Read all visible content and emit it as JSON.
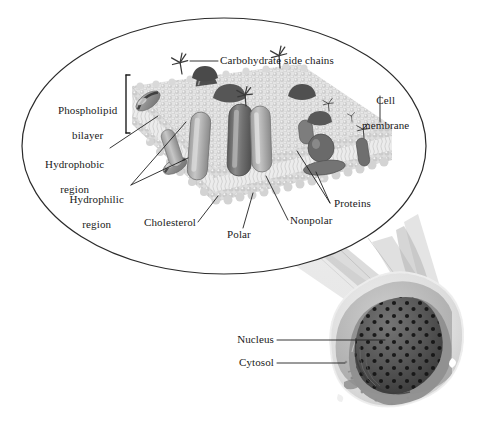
{
  "figure": {
    "background_color": "#ffffff",
    "ink_color": "#1a1a1a"
  },
  "inset": {
    "shape": "ellipse",
    "outline_color": "#2b2b2b",
    "center_x": 224,
    "center_y": 146,
    "radius_x": 202,
    "radius_y": 128
  },
  "labels": {
    "carbohydrate_side_chains": "Carbohydrate side chains",
    "cell_membrane_line1": "Cell",
    "cell_membrane_line2": "membrane",
    "phospholipid_line1": "Phospholipid",
    "phospholipid_line2": "bilayer",
    "hydrophobic_line1": "Hydrophobic",
    "hydrophobic_line2": "region",
    "hydrophilic_line1": "Hydrophilic",
    "hydrophilic_line2": "region",
    "cholesterol": "Cholesterol",
    "polar": "Polar",
    "nonpolar": "Nonpolar",
    "proteins": "Proteins",
    "nucleus": "Nucleus",
    "cytosol": "Cytosol"
  },
  "colors": {
    "membrane_head_light": "#d8d8d8",
    "membrane_head_mid": "#c4c4c4",
    "membrane_tail": "#e2e2e2",
    "protein_dark": "#6a6a6a",
    "protein_mid": "#8e8e8e",
    "protein_light": "#b0b0b0",
    "cholesterol": "#9a9a9a",
    "cell_cytoplasm": "#cfcfcf",
    "cell_outer": "#dcdcdc",
    "nucleus_dark": "#4e4e4e",
    "nucleus_pore": "#1c1c1c",
    "beam_gray": "#b6b6b6",
    "leader_line": "#2b2b2b"
  },
  "cell": {
    "name": "animal-cell-cutaway",
    "center_x": 385,
    "center_y": 365,
    "nucleus_label_target": "nucleus",
    "cytosol_label_target": "cytosol"
  },
  "membrane_features": {
    "carbohydrate_chain_count": 6,
    "integral_protein_count": 6,
    "peripheral_protein_count": 2,
    "cholesterol_count": 3
  }
}
